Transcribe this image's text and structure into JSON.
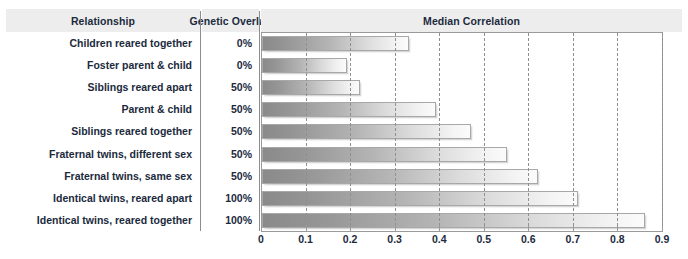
{
  "table": {
    "columns": [
      {
        "key": "relationship",
        "label": "Relationship"
      },
      {
        "key": "genetic_overlap",
        "label": "Genetic Overlap"
      },
      {
        "key": "median_correlation",
        "label": "Median Correlation"
      }
    ],
    "rows": [
      {
        "relationship": "Children reared together",
        "genetic_overlap": "0%",
        "median_correlation": 0.33
      },
      {
        "relationship": "Foster parent & child",
        "genetic_overlap": "0%",
        "median_correlation": 0.19
      },
      {
        "relationship": "Siblings reared apart",
        "genetic_overlap": "50%",
        "median_correlation": 0.22
      },
      {
        "relationship": "Parent & child",
        "genetic_overlap": "50%",
        "median_correlation": 0.39
      },
      {
        "relationship": "Siblings reared together",
        "genetic_overlap": "50%",
        "median_correlation": 0.47
      },
      {
        "relationship": "Fraternal twins, different sex",
        "genetic_overlap": "50%",
        "median_correlation": 0.55
      },
      {
        "relationship": "Fraternal twins, same sex",
        "genetic_overlap": "50%",
        "median_correlation": 0.62
      },
      {
        "relationship": "Identical twins, reared apart",
        "genetic_overlap": "100%",
        "median_correlation": 0.71
      },
      {
        "relationship": "Identical twins, reared together",
        "genetic_overlap": "100%",
        "median_correlation": 0.86
      }
    ]
  },
  "chart_data": {
    "type": "bar",
    "orientation": "horizontal",
    "title": "Median Correlation",
    "xlabel": "",
    "ylabel": "",
    "categories": [
      "Children reared together",
      "Foster parent & child",
      "Siblings reared apart",
      "Parent & child",
      "Siblings reared together",
      "Fraternal twins, different sex",
      "Fraternal twins, same sex",
      "Identical twins, reared apart",
      "Identical twins, reared together"
    ],
    "values": [
      0.33,
      0.19,
      0.22,
      0.39,
      0.47,
      0.55,
      0.62,
      0.71,
      0.86
    ],
    "xlim": [
      0,
      0.9
    ],
    "xticks": [
      0,
      0.1,
      0.2,
      0.3,
      0.4,
      0.5,
      0.6,
      0.7,
      0.8,
      0.9
    ],
    "xtick_labels": [
      "0",
      "0.1",
      "0.2",
      "0.3",
      "0.4",
      "0.5",
      "0.6",
      "0.7",
      "0.8",
      "0.9"
    ],
    "grid": "vertical-dashed",
    "legend": "none",
    "bar_fill": "gradient gray to white",
    "colors": {
      "bar_dark": "#8a8a8a",
      "bar_light": "#fbfbfb",
      "bar_border": "#a8a8a8",
      "header_bg": "#ededed",
      "text": "#1b2a3d",
      "rule": "#8d8d8d"
    }
  }
}
